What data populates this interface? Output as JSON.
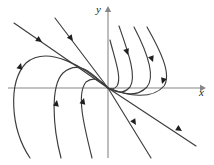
{
  "figure": {
    "background_color": "#ffffff",
    "width": 214,
    "height": 165
  },
  "axes": {
    "x_axis": {
      "label": "x",
      "label_x": 199,
      "label_y": 96,
      "color": "#878787",
      "y_position": 88,
      "x_start": 8,
      "x_end": 200,
      "arrow": "right"
    },
    "y_axis": {
      "label": "y",
      "label_x": 96,
      "label_y": 13,
      "color": "#878787",
      "x_position": 108,
      "y_start": 158,
      "y_end": 12,
      "arrow": "up"
    },
    "origin": {
      "x": 108,
      "y": 88
    }
  },
  "chart_data": {
    "type": "line",
    "xlabel": "x",
    "ylabel": "y",
    "grid": false,
    "legend": false,
    "xlim": [
      8,
      200
    ],
    "ylim": [
      158,
      12
    ],
    "equilibrium": {
      "x": 108,
      "y": 88,
      "kind": "degenerate-node",
      "stability": "mixed"
    },
    "curve_color": "#3d3d3d",
    "trajectory_count": 11,
    "arrowhead_count": 12,
    "trajectories": [
      {
        "name": "upper-left-straight-outer",
        "direction": "toward-origin",
        "path": "M 14,23 L 108,88",
        "arrow": {
          "x": 42,
          "y": 42,
          "angle": 35
        }
      },
      {
        "name": "upper-left-straight-inner",
        "direction": "toward-origin",
        "path": "M 55,18 L 108,88",
        "arrow": {
          "x": 73,
          "y": 41,
          "angle": 53
        }
      },
      {
        "name": "left-outer-loop",
        "direction": "toward-origin",
        "path": "M 30,158 C 10,128 8,82 26,63 C 48,44 86,68 108,88",
        "arrow": {
          "x": 21,
          "y": 63,
          "angle": -75
        }
      },
      {
        "name": "left-middle-loop",
        "direction": "toward-origin",
        "path": "M 61,158 C 53,128 50,86 63,73 C 80,58 94,76 108,88",
        "arrow": {
          "x": 57,
          "y": 100,
          "angle": -80
        }
      },
      {
        "name": "left-inner-loop",
        "direction": "toward-origin",
        "path": "M 92,158 C 84,126 76,94 86,82 C 95,75 102,82 108,88",
        "arrow": {
          "x": 84,
          "y": 98,
          "angle": -75
        }
      },
      {
        "name": "right-outer-hook",
        "direction": "toward-origin",
        "path": "M 147,27 C 160,50 172,74 164,86 C 152,100 128,96 108,88",
        "arrow": {
          "x": 162,
          "y": 84,
          "angle": 108
        }
      },
      {
        "name": "right-middle-hook",
        "direction": "toward-origin",
        "path": "M 134,27 C 146,50 156,76 147,87 C 136,98 124,94 108,88",
        "arrow": {
          "x": 153,
          "y": 62,
          "angle": 70
        }
      },
      {
        "name": "right-inner-hook",
        "direction": "toward-origin",
        "path": "M 119,26 C 128,52 137,76 130,87 C 123,95 116,92 108,88",
        "arrow": {
          "x": 128,
          "y": 55,
          "angle": 72
        }
      },
      {
        "name": "right-innermost-hook",
        "direction": "toward-origin",
        "path": "M 110,40 C 115,60 122,78 117,86 C 114,90 111,89 108,88",
        "arrow": null
      },
      {
        "name": "lower-right-straight-inner",
        "direction": "away-from-origin",
        "path": "M 108,88 L 151,158",
        "arrow": {
          "x": 136,
          "y": 125,
          "angle": 58
        }
      },
      {
        "name": "lower-right-straight-outer",
        "direction": "away-from-origin",
        "path": "M 108,88 L 196,146",
        "arrow": {
          "x": 182,
          "y": 131,
          "angle": 33
        }
      }
    ]
  }
}
